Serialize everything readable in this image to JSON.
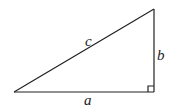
{
  "diagram": {
    "type": "right-triangle",
    "labels": {
      "hypotenuse": "c",
      "vertical_leg": "b",
      "horizontal_leg": "a"
    },
    "right_angle_marker": true,
    "stroke_color": "#222222"
  }
}
